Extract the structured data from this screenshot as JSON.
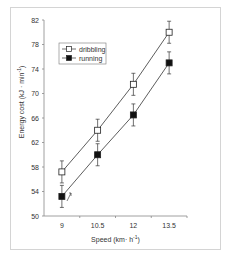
{
  "chart_data": {
    "type": "line",
    "title": "",
    "xlabel": "Speed (km·h⁻¹)",
    "ylabel": "Energy cost (kJ·min⁻¹)",
    "categories": [
      "9",
      "10.5",
      "12",
      "13.5"
    ],
    "ylim": [
      50,
      82
    ],
    "yticks": [
      50,
      54,
      58,
      62,
      66,
      70,
      74,
      78,
      82
    ],
    "grid": false,
    "legend_position": "upper-left",
    "series": [
      {
        "name": "dribbling",
        "marker": "open-square",
        "values": [
          57.2,
          64.0,
          71.5,
          80.0
        ],
        "error": [
          1.8,
          1.8,
          1.8,
          1.8
        ]
      },
      {
        "name": "running",
        "marker": "filled-square",
        "values": [
          53.2,
          60.0,
          66.5,
          75.0
        ],
        "error": [
          1.8,
          1.8,
          1.8,
          1.8
        ]
      }
    ]
  },
  "labels": {
    "xlabel": "Speed (km· h",
    "xlabel_sup": "-1",
    "xlabel_end": ")",
    "ylabel": "Energy cost (kJ · min",
    "ylabel_sup": "-1",
    "ylabel_end": ")",
    "legend": [
      "dribbling",
      "running"
    ],
    "yticks": [
      "50",
      "54",
      "58",
      "62",
      "66",
      "70",
      "74",
      "78",
      "82"
    ],
    "xticks": [
      "9",
      "10.5",
      "12",
      "13.5"
    ]
  }
}
